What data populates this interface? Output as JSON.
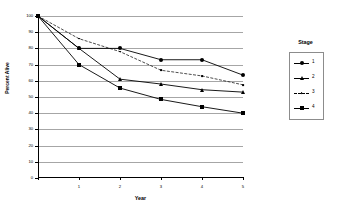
{
  "chart_data": {
    "type": "line",
    "title": "",
    "xlabel": "Year",
    "ylabel": "Percent Alive",
    "x": [
      0,
      1,
      2,
      3,
      4,
      5
    ],
    "xtick_labels": [
      "",
      "1",
      "2",
      "3",
      "4",
      "5"
    ],
    "xlim": [
      0,
      5
    ],
    "ylim": [
      0,
      100
    ],
    "ytick_labels": [
      "0",
      "10",
      "20",
      "30",
      "40",
      "50",
      "60",
      "70",
      "80",
      "90",
      "100"
    ],
    "ytick_values": [
      0,
      10,
      20,
      30,
      40,
      50,
      60,
      70,
      80,
      90,
      100
    ],
    "grid": "horizontal",
    "legend_position": "right",
    "legend_title": "Stage",
    "series": [
      {
        "name": "1",
        "marker": "circle",
        "values": [
          100,
          80,
          80,
          73,
          73,
          63.5
        ]
      },
      {
        "name": "2",
        "marker": "triangle",
        "values": [
          100,
          80,
          61,
          58,
          54.5,
          53
        ]
      },
      {
        "name": "3",
        "marker": "dot",
        "values": [
          100,
          86,
          78,
          66.5,
          63,
          57.5
        ]
      },
      {
        "name": "4",
        "marker": "square",
        "values": [
          100,
          70,
          55.5,
          48.5,
          44,
          40
        ]
      }
    ]
  },
  "legend": {
    "title": "Stage",
    "items": [
      {
        "label": "1",
        "marker": "circle-marker-icon"
      },
      {
        "label": "2",
        "marker": "triangle-marker-icon"
      },
      {
        "label": "3",
        "marker": "dot-marker-icon"
      },
      {
        "label": "4",
        "marker": "square-marker-icon"
      }
    ]
  },
  "axes": {
    "x_title": "Year",
    "y_title": "Percent Alive"
  }
}
